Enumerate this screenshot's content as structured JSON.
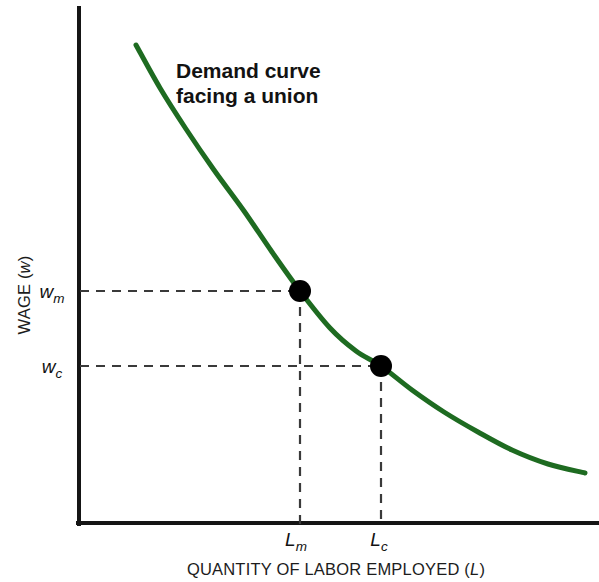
{
  "figure": {
    "background_color": "#ffffff",
    "width": 599,
    "height": 582
  },
  "annotation": {
    "line1": "Demand curve",
    "line2": "facing a union"
  },
  "axes": {
    "x_title_prefix": "QUANTITY OF LABOR EMPLOYED (",
    "x_title_symbol": "L",
    "x_title_suffix": ")",
    "y_title_prefix": "WAGE (",
    "y_title_symbol": "w",
    "y_title_suffix": ")",
    "axis_color": "#151515"
  },
  "ticks": {
    "y": [
      {
        "symbol": "w",
        "subscript": "m",
        "value_label": "w_m",
        "pixel_y": 291
      },
      {
        "symbol": "w",
        "subscript": "c",
        "value_label": "w_c",
        "pixel_y": 366
      }
    ],
    "x": [
      {
        "symbol": "L",
        "subscript": "m",
        "value_label": "L_m",
        "pixel_x": 300
      },
      {
        "symbol": "L",
        "subscript": "c",
        "value_label": "L_c",
        "pixel_x": 381
      }
    ]
  },
  "chart_data": {
    "type": "line",
    "title": "Demand curve facing a union",
    "xlabel": "QUANTITY OF LABOR EMPLOYED (L)",
    "ylabel": "WAGE (w)",
    "grid": false,
    "legend": "none",
    "axis_ticks_numeric": false,
    "xlim_pixels": [
      78,
      599
    ],
    "ylim_pixels": [
      8,
      524
    ],
    "series": [
      {
        "name": "Demand curve facing a union",
        "color": "#1e6b21",
        "line_width": 5,
        "path_points": [
          [
            136,
            45
          ],
          [
            160,
            88
          ],
          [
            186,
            129
          ],
          [
            214,
            170
          ],
          [
            244,
            211
          ],
          [
            272,
            252
          ],
          [
            300,
            291
          ],
          [
            330,
            328
          ],
          [
            356,
            351
          ],
          [
            381,
            366
          ],
          [
            412,
            390
          ],
          [
            444,
            412
          ],
          [
            478,
            432
          ],
          [
            512,
            450
          ],
          [
            548,
            464
          ],
          [
            585,
            473
          ]
        ]
      }
    ],
    "points": [
      {
        "name": "union-wage-point",
        "x_label": "L_m",
        "y_label": "w_m",
        "pixel_x": 300,
        "pixel_y": 291,
        "radius": 11,
        "color": "#000000"
      },
      {
        "name": "competitive-wage-point",
        "x_label": "L_c",
        "y_label": "w_c",
        "pixel_x": 381,
        "pixel_y": 366,
        "radius": 11,
        "color": "#000000"
      }
    ],
    "guide_lines": [
      {
        "name": "wm-horizontal",
        "from": [
          80,
          291
        ],
        "to": [
          300,
          291
        ]
      },
      {
        "name": "lm-vertical",
        "from": [
          300,
          291
        ],
        "to": [
          300,
          524
        ]
      },
      {
        "name": "wc-horizontal",
        "from": [
          80,
          366
        ],
        "to": [
          381,
          366
        ]
      },
      {
        "name": "lc-vertical",
        "from": [
          381,
          366
        ],
        "to": [
          381,
          524
        ]
      }
    ],
    "annotations": [
      {
        "text": "Demand curve facing a union",
        "pixel_x": 176,
        "pixel_y": 78,
        "bold": true
      }
    ]
  }
}
